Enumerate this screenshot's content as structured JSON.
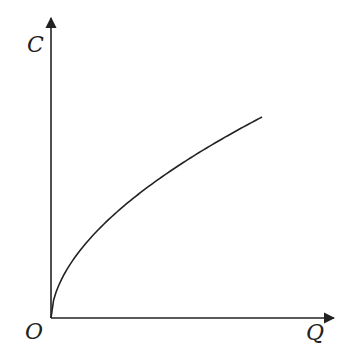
{
  "diagram": {
    "title": "",
    "y_axis_label": "C",
    "x_axis_label": "Q",
    "origin_label": "O",
    "line_color": "#222222",
    "background": "#ffffff"
  },
  "chart_data": {
    "type": "line",
    "title": "",
    "xlabel": "Q",
    "ylabel": "C",
    "origin": "O",
    "x": [
      0,
      0.05,
      0.1,
      0.2,
      0.3,
      0.4,
      0.5,
      0.6,
      0.7,
      0.8,
      0.9,
      1.0
    ],
    "series": [
      {
        "name": "C(Q)",
        "values": [
          0,
          0.19,
          0.28,
          0.41,
          0.52,
          0.6,
          0.68,
          0.76,
          0.82,
          0.88,
          0.94,
          1.0
        ]
      }
    ],
    "xlim": [
      0,
      1.35
    ],
    "ylim": [
      0,
      1.5
    ],
    "grid": false,
    "ticks": false
  }
}
